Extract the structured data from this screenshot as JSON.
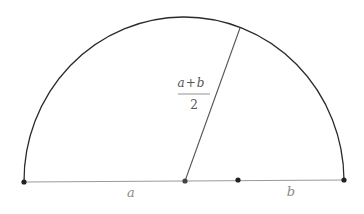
{
  "diagram": {
    "type": "semicircle-geometry",
    "colors": {
      "arc": "#2a2a2a",
      "radius": "#555555",
      "diameter": "#9a9a9a",
      "points": "#222222",
      "labels": "#8a8a8a",
      "fraction": "#555555"
    },
    "geometry": {
      "center": [
        185,
        181
      ],
      "radius": 160,
      "left_end": [
        24,
        182
      ],
      "right_end": [
        344,
        180
      ],
      "split_point": [
        238,
        180
      ],
      "radius_end": [
        240,
        28
      ]
    },
    "points": [
      {
        "name": "left-endpoint",
        "x": 24,
        "y": 182
      },
      {
        "name": "center-point",
        "x": 185,
        "y": 181
      },
      {
        "name": "split-point",
        "x": 238,
        "y": 180
      },
      {
        "name": "right-endpoint",
        "x": 344,
        "y": 180
      }
    ],
    "labels": {
      "segment_a": "a",
      "segment_b": "b",
      "radius_numerator": "a+b",
      "radius_numerator_a": "a",
      "radius_numerator_plus": "+",
      "radius_numerator_b": "b",
      "radius_denominator": "2"
    }
  }
}
